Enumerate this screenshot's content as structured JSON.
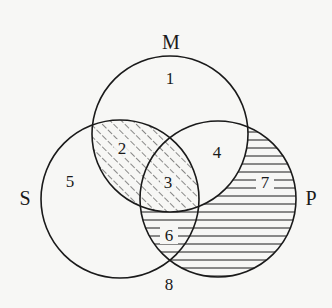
{
  "diagram": {
    "type": "venn",
    "sets": [
      {
        "name": "M",
        "label": "M",
        "cx": 170,
        "cy": 134,
        "r": 78,
        "label_x": 171,
        "label_y": 42
      },
      {
        "name": "S",
        "label": "S",
        "cx": 120,
        "cy": 199,
        "r": 79,
        "label_x": 25,
        "label_y": 198
      },
      {
        "name": "P",
        "label": "P",
        "cx": 218,
        "cy": 199,
        "r": 78,
        "label_x": 311,
        "label_y": 198
      }
    ],
    "regions": [
      {
        "id": "1",
        "label": "1",
        "x": 170,
        "y": 78,
        "membership": "M only",
        "shading": "none"
      },
      {
        "id": "2",
        "label": "2",
        "x": 122,
        "y": 148,
        "membership": "M and S, not P",
        "shading": "diagonal"
      },
      {
        "id": "3",
        "label": "3",
        "x": 168,
        "y": 182,
        "membership": "M and S and P",
        "shading": "diagonal"
      },
      {
        "id": "4",
        "label": "4",
        "x": 217,
        "y": 152,
        "membership": "M and P, not S",
        "shading": "none"
      },
      {
        "id": "5",
        "label": "5",
        "x": 70,
        "y": 181,
        "membership": "S only",
        "shading": "none"
      },
      {
        "id": "6",
        "label": "6",
        "x": 169,
        "y": 235,
        "membership": "S and P, not M",
        "shading": "horizontal"
      },
      {
        "id": "7",
        "label": "7",
        "x": 265,
        "y": 182,
        "membership": "P only",
        "shading": "horizontal"
      },
      {
        "id": "8",
        "label": "8",
        "x": 169,
        "y": 284,
        "membership": "outside all",
        "shading": "none"
      }
    ],
    "colors": {
      "stroke": "#1a1a1a",
      "background": "#f7f7f5"
    }
  }
}
